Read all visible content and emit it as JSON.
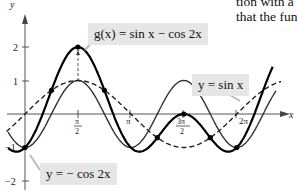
{
  "page_text": {
    "line1": "tion with a",
    "line2": "that the func"
  },
  "labels": {
    "g": "g(x) =  sin x  −  cos 2x",
    "sin": "y =  sin x",
    "negcos": "y = − cos 2x"
  },
  "axes": {
    "x_label": "x",
    "y_label": "y"
  },
  "chart_data": {
    "type": "line",
    "title": "",
    "xlabel": "x",
    "ylabel": "y",
    "xlim": [
      -0.5,
      7.5
    ],
    "ylim": [
      -2,
      2
    ],
    "grid": false,
    "x_ticks": [
      "π/2",
      "π",
      "3π/2",
      "2π"
    ],
    "y_ticks": [
      "-2",
      "-1",
      "1",
      "2"
    ],
    "series": [
      {
        "name": "g(x) = sin x − cos 2x",
        "style": "thick solid",
        "x": [
          0,
          0.5236,
          1.5708,
          2.618,
          3.1416,
          3.6652,
          4.7124,
          5.7596,
          6.2832
        ],
        "values": [
          -1,
          0,
          2,
          0,
          -1,
          -1,
          0,
          -1,
          -1
        ]
      },
      {
        "name": "y = sin x",
        "style": "dashed",
        "x": [
          0,
          1.5708,
          3.1416,
          4.7124,
          6.2832
        ],
        "values": [
          0,
          1,
          0,
          -1,
          0
        ]
      },
      {
        "name": "y = − cos 2x",
        "style": "thin solid",
        "x": [
          0,
          0.7854,
          1.5708,
          2.3562,
          3.1416,
          3.927,
          4.7124,
          5.4978,
          6.2832
        ],
        "values": [
          -1,
          0,
          1,
          0,
          -1,
          0,
          1,
          0,
          -1
        ]
      }
    ],
    "annotations": [
      "dashed vertical at x = π/2 from 1 to 2",
      "marked points where curves intersect"
    ]
  }
}
